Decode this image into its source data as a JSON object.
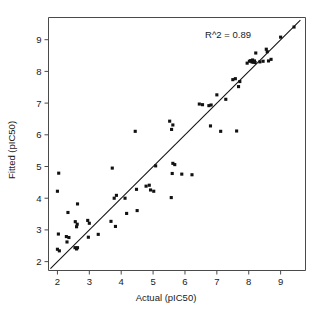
{
  "chart_data": {
    "type": "scatter",
    "title": "",
    "xlabel": "Actual (pIC50)",
    "ylabel": "Fitted (pIC50)",
    "xlim": [
      1.72,
      9.78
    ],
    "ylim": [
      1.72,
      9.7
    ],
    "xticks": [
      2,
      3,
      4,
      5,
      6,
      7,
      8,
      9
    ],
    "yticks": [
      2,
      3,
      4,
      5,
      6,
      7,
      8,
      9
    ],
    "xticklabels": [
      "2",
      "3",
      "4",
      "5",
      "6",
      "7",
      "8",
      "9"
    ],
    "yticklabels": [
      "2",
      "3",
      "4",
      "5",
      "6",
      "7",
      "8",
      "9"
    ],
    "grid": false,
    "legend": null,
    "annotations": [
      {
        "text": "R^2 = 0.89",
        "x": 7.35,
        "y": 9.05
      }
    ],
    "marker": {
      "shape": "square",
      "color": "#111111",
      "size_px": 3.1
    },
    "reference_line": {
      "label": "identity-fit-line",
      "color": "#111111",
      "x_start": 1.78,
      "y_start": 1.78,
      "x_end": 9.62,
      "y_end": 9.62
    },
    "points": [
      {
        "x": 2.04,
        "y": 4.79
      },
      {
        "x": 2.0,
        "y": 4.22
      },
      {
        "x": 2.33,
        "y": 3.55
      },
      {
        "x": 2.63,
        "y": 3.82
      },
      {
        "x": 2.03,
        "y": 2.87
      },
      {
        "x": 2.0,
        "y": 2.39
      },
      {
        "x": 2.06,
        "y": 2.34
      },
      {
        "x": 2.28,
        "y": 2.79
      },
      {
        "x": 2.3,
        "y": 2.62
      },
      {
        "x": 2.36,
        "y": 2.76
      },
      {
        "x": 2.56,
        "y": 3.26
      },
      {
        "x": 2.6,
        "y": 3.1
      },
      {
        "x": 2.62,
        "y": 3.18
      },
      {
        "x": 2.55,
        "y": 2.44
      },
      {
        "x": 2.6,
        "y": 2.4
      },
      {
        "x": 2.63,
        "y": 2.44
      },
      {
        "x": 2.95,
        "y": 3.3
      },
      {
        "x": 3.0,
        "y": 3.21
      },
      {
        "x": 2.97,
        "y": 2.77
      },
      {
        "x": 3.28,
        "y": 2.86
      },
      {
        "x": 3.72,
        "y": 4.95
      },
      {
        "x": 3.78,
        "y": 4.0
      },
      {
        "x": 3.85,
        "y": 4.09
      },
      {
        "x": 3.68,
        "y": 3.27
      },
      {
        "x": 3.82,
        "y": 3.11
      },
      {
        "x": 4.12,
        "y": 4.0
      },
      {
        "x": 4.17,
        "y": 3.52
      },
      {
        "x": 4.44,
        "y": 6.11
      },
      {
        "x": 4.48,
        "y": 4.28
      },
      {
        "x": 4.5,
        "y": 3.61
      },
      {
        "x": 4.78,
        "y": 4.38
      },
      {
        "x": 4.88,
        "y": 4.41
      },
      {
        "x": 4.92,
        "y": 4.26
      },
      {
        "x": 5.02,
        "y": 4.22
      },
      {
        "x": 5.08,
        "y": 5.02
      },
      {
        "x": 5.52,
        "y": 6.43
      },
      {
        "x": 5.62,
        "y": 6.31
      },
      {
        "x": 5.58,
        "y": 6.17
      },
      {
        "x": 5.62,
        "y": 5.1
      },
      {
        "x": 5.68,
        "y": 5.06
      },
      {
        "x": 5.6,
        "y": 4.78
      },
      {
        "x": 5.57,
        "y": 4.02
      },
      {
        "x": 5.9,
        "y": 4.76
      },
      {
        "x": 6.22,
        "y": 4.74
      },
      {
        "x": 6.45,
        "y": 6.97
      },
      {
        "x": 6.55,
        "y": 6.95
      },
      {
        "x": 6.75,
        "y": 6.92
      },
      {
        "x": 6.82,
        "y": 6.94
      },
      {
        "x": 6.8,
        "y": 6.28
      },
      {
        "x": 7.0,
        "y": 7.26
      },
      {
        "x": 7.12,
        "y": 6.11
      },
      {
        "x": 7.28,
        "y": 7.12
      },
      {
        "x": 7.5,
        "y": 7.74
      },
      {
        "x": 7.58,
        "y": 7.77
      },
      {
        "x": 7.62,
        "y": 6.12
      },
      {
        "x": 7.68,
        "y": 7.52
      },
      {
        "x": 7.72,
        "y": 7.68
      },
      {
        "x": 7.95,
        "y": 8.26
      },
      {
        "x": 8.02,
        "y": 8.32
      },
      {
        "x": 8.06,
        "y": 8.34
      },
      {
        "x": 8.1,
        "y": 8.3
      },
      {
        "x": 8.12,
        "y": 8.36
      },
      {
        "x": 8.14,
        "y": 8.29
      },
      {
        "x": 8.18,
        "y": 8.33
      },
      {
        "x": 8.2,
        "y": 8.28
      },
      {
        "x": 8.22,
        "y": 8.58
      },
      {
        "x": 8.35,
        "y": 8.3
      },
      {
        "x": 8.45,
        "y": 8.32
      },
      {
        "x": 8.55,
        "y": 8.7
      },
      {
        "x": 8.58,
        "y": 8.62
      },
      {
        "x": 8.62,
        "y": 8.33
      },
      {
        "x": 8.7,
        "y": 8.38
      },
      {
        "x": 9.0,
        "y": 9.08
      },
      {
        "x": 9.42,
        "y": 9.4
      }
    ]
  }
}
